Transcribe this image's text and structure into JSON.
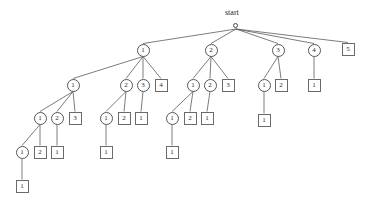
{
  "diagram": {
    "start_label": "start",
    "colors": {
      "background": "#ffffff",
      "circle_stroke": "#555555",
      "square_stroke": "#6a6a6a",
      "edge_stroke": "#5a5a5a",
      "text": "#2b2b2b"
    },
    "nodes": [
      {
        "id": "start",
        "label": "start",
        "shape": "start",
        "x": 236,
        "y": 26
      },
      {
        "id": "n1",
        "label": "1",
        "shape": "circle",
        "x": 143,
        "y": 50
      },
      {
        "id": "n2",
        "label": "2",
        "shape": "circle",
        "x": 211,
        "y": 50
      },
      {
        "id": "n3",
        "label": "3",
        "shape": "circle",
        "x": 278,
        "y": 50
      },
      {
        "id": "n4",
        "label": "4",
        "shape": "circle",
        "x": 314,
        "y": 50
      },
      {
        "id": "n5",
        "label": "5",
        "shape": "square",
        "x": 348,
        "y": 49
      },
      {
        "id": "n1_1",
        "label": "1",
        "shape": "circle",
        "x": 73,
        "y": 85
      },
      {
        "id": "n1_2",
        "label": "2",
        "shape": "circle",
        "x": 126,
        "y": 85
      },
      {
        "id": "n1_3",
        "label": "3",
        "shape": "circle",
        "x": 143,
        "y": 85
      },
      {
        "id": "n1_4",
        "label": "4",
        "shape": "square",
        "x": 161,
        "y": 85
      },
      {
        "id": "n2_1",
        "label": "1",
        "shape": "circle",
        "x": 193,
        "y": 85
      },
      {
        "id": "n2_2",
        "label": "2",
        "shape": "circle",
        "x": 210,
        "y": 85
      },
      {
        "id": "n2_3",
        "label": "3",
        "shape": "square",
        "x": 228,
        "y": 85
      },
      {
        "id": "n3_1",
        "label": "1",
        "shape": "circle",
        "x": 264,
        "y": 85
      },
      {
        "id": "n3_2",
        "label": "2",
        "shape": "square",
        "x": 281,
        "y": 85
      },
      {
        "id": "n4_1",
        "label": "1",
        "shape": "square",
        "x": 314,
        "y": 85
      },
      {
        "id": "n1_1_1",
        "label": "1",
        "shape": "circle",
        "x": 40,
        "y": 118
      },
      {
        "id": "n1_1_2",
        "label": "2",
        "shape": "circle",
        "x": 57,
        "y": 118
      },
      {
        "id": "n1_1_3",
        "label": "3",
        "shape": "square",
        "x": 75,
        "y": 118
      },
      {
        "id": "n1_2_1",
        "label": "1",
        "shape": "circle",
        "x": 106,
        "y": 118
      },
      {
        "id": "n1_2_2",
        "label": "2",
        "shape": "square",
        "x": 124,
        "y": 118
      },
      {
        "id": "n1_2_3",
        "label": "1",
        "shape": "square",
        "x": 141,
        "y": 118
      },
      {
        "id": "n2_1_1",
        "label": "1",
        "shape": "circle",
        "x": 172,
        "y": 118
      },
      {
        "id": "n2_1_2",
        "label": "2",
        "shape": "square",
        "x": 190,
        "y": 118
      },
      {
        "id": "n2_1_3",
        "label": "1",
        "shape": "square",
        "x": 207,
        "y": 118
      },
      {
        "id": "n3_1_1",
        "label": "1",
        "shape": "square",
        "x": 264,
        "y": 120
      },
      {
        "id": "n1_1_1_1",
        "label": "1",
        "shape": "circle",
        "x": 22,
        "y": 152
      },
      {
        "id": "n1_1_1_2",
        "label": "2",
        "shape": "square",
        "x": 40,
        "y": 152
      },
      {
        "id": "n1_1_2_1",
        "label": "1",
        "shape": "square",
        "x": 57,
        "y": 152
      },
      {
        "id": "n1_2_1_1",
        "label": "1",
        "shape": "square",
        "x": 106,
        "y": 152
      },
      {
        "id": "n2_1_1_1",
        "label": "1",
        "shape": "square",
        "x": 172,
        "y": 152
      },
      {
        "id": "n1_1_1_1_1",
        "label": "1",
        "shape": "square",
        "x": 22,
        "y": 186
      }
    ],
    "edges": [
      {
        "from": "start",
        "to": "n1"
      },
      {
        "from": "start",
        "to": "n2"
      },
      {
        "from": "start",
        "to": "n3"
      },
      {
        "from": "start",
        "to": "n4"
      },
      {
        "from": "start",
        "to": "n5"
      },
      {
        "from": "n1",
        "to": "n1_1"
      },
      {
        "from": "n1",
        "to": "n1_2"
      },
      {
        "from": "n1",
        "to": "n1_3"
      },
      {
        "from": "n1",
        "to": "n1_4"
      },
      {
        "from": "n2",
        "to": "n2_1"
      },
      {
        "from": "n2",
        "to": "n2_2"
      },
      {
        "from": "n2",
        "to": "n2_3"
      },
      {
        "from": "n3",
        "to": "n3_1"
      },
      {
        "from": "n3",
        "to": "n3_2"
      },
      {
        "from": "n4",
        "to": "n4_1"
      },
      {
        "from": "n1_1",
        "to": "n1_1_1"
      },
      {
        "from": "n1_1",
        "to": "n1_1_2"
      },
      {
        "from": "n1_1",
        "to": "n1_1_3"
      },
      {
        "from": "n1_2",
        "to": "n1_2_1"
      },
      {
        "from": "n1_2",
        "to": "n1_2_2"
      },
      {
        "from": "n1_3",
        "to": "n1_2_3"
      },
      {
        "from": "n2_1",
        "to": "n2_1_1"
      },
      {
        "from": "n2_1",
        "to": "n2_1_2"
      },
      {
        "from": "n2_2",
        "to": "n2_1_3"
      },
      {
        "from": "n3_1",
        "to": "n3_1_1"
      },
      {
        "from": "n1_1_1",
        "to": "n1_1_1_1"
      },
      {
        "from": "n1_1_1",
        "to": "n1_1_1_2"
      },
      {
        "from": "n1_1_2",
        "to": "n1_1_2_1"
      },
      {
        "from": "n1_2_1",
        "to": "n1_2_1_1"
      },
      {
        "from": "n2_1_1",
        "to": "n2_1_1_1"
      },
      {
        "from": "n1_1_1_1",
        "to": "n1_1_1_1_1"
      }
    ]
  }
}
